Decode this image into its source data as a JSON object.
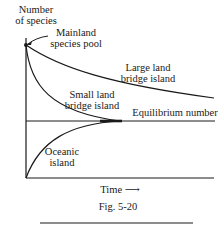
{
  "figure": {
    "y_axis_label_line1": "Number",
    "y_axis_label_line2": "of species",
    "x_axis_label": "Time ⟶",
    "caption": "Fig. 5-20"
  },
  "annotations": {
    "mainland_line1": "Mainland",
    "mainland_line2": "species pool",
    "large_line1": "Large land",
    "large_line2": "bridge island",
    "small_line1": "Small land",
    "small_line2": "bridge island",
    "equilibrium": "Equilibrium number",
    "oceanic_line1": "Oceanic",
    "oceanic_line2": "island"
  },
  "colors": {
    "ink": "#1a1a1a",
    "background": "#ffffff"
  }
}
